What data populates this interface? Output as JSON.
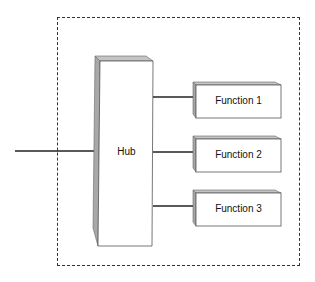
{
  "diagram": {
    "hub": {
      "label": "Hub"
    },
    "functions": [
      {
        "label": "Function 1"
      },
      {
        "label": "Function 2"
      },
      {
        "label": "Function 3"
      }
    ],
    "colors": {
      "face": "#ffffff",
      "bevel_side": "#a8a8a8",
      "bevel_top": "#c4c4c4",
      "edge": "#555555",
      "connector": "#222222",
      "frame": "#333333"
    }
  }
}
